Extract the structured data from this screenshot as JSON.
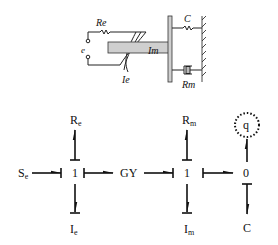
{
  "schematic": {
    "labels": {
      "resistor_e": "Re",
      "source": "e",
      "inductance_e": "Ie",
      "mass": "Im",
      "spring": "C",
      "damper": "Rm"
    }
  },
  "bond_graph": {
    "nodes": {
      "source": {
        "base": "S",
        "sub": "e"
      },
      "junction1_left": "1",
      "gyrator": "GY",
      "junction1_right": "1",
      "junction0": "0",
      "re": {
        "base": "R",
        "sub": "e"
      },
      "ie": {
        "base": "I",
        "sub": "e"
      },
      "rm": {
        "base": "R",
        "sub": "m"
      },
      "im": {
        "base": "I",
        "sub": "m"
      },
      "c": "C",
      "q": "q"
    }
  }
}
